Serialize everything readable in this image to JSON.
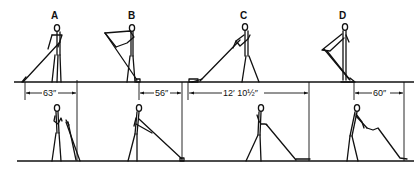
{
  "diagram": {
    "figures": [
      {
        "id": "A",
        "label": "A",
        "distance": "63″"
      },
      {
        "id": "B",
        "label": "B",
        "distance": "56″"
      },
      {
        "id": "C",
        "label": "C",
        "distance": "12′ 10½″"
      },
      {
        "id": "D",
        "label": "D",
        "distance": "60″"
      }
    ],
    "rows": {
      "top": "Standing reach positions A-D",
      "bottom": "Corresponding lower positions with measured reach"
    }
  }
}
